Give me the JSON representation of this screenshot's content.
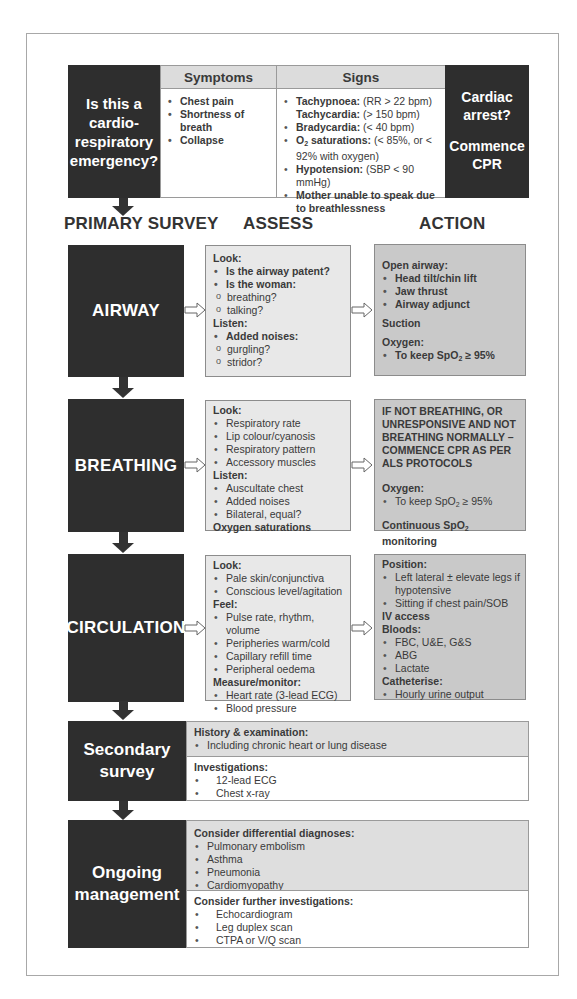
{
  "top_section": {
    "question": [
      "Is this a",
      "cardio-",
      "respiratory",
      "emergency?"
    ],
    "symptoms": {
      "header": "Symptoms",
      "items": [
        "Chest pain",
        "Shortness of breath",
        "Collapse"
      ]
    },
    "signs": {
      "header": "Signs",
      "items": [
        {
          "label": "Tachypnoea:",
          "value": " (RR > 22 bpm)"
        },
        {
          "label": "Tachycardia:",
          "value": " (> 150 bpm)"
        },
        {
          "label": "Bradycardia:",
          "value": " (< 40 bpm)"
        },
        {
          "label_prefix": "O",
          "label_sub": "2",
          "label": " saturations:",
          "value": " (< 85%, or < 92% with oxygen)"
        },
        {
          "label": "Hypotension:",
          "value": " (SBP < 90 mmHg)"
        },
        {
          "label": "Mother unable to speak due to breathlessness",
          "value": ""
        }
      ]
    },
    "arrest": {
      "question": [
        "Cardiac",
        "arrest?"
      ],
      "action": [
        "Commence",
        "CPR"
      ]
    }
  },
  "column_headers": {
    "primary": "PRIMARY SURVEY",
    "assess": "ASSESS",
    "action": "ACTION"
  },
  "airway": {
    "title": "AIRWAY",
    "assess": {
      "look_label": "Look:",
      "look_items": [
        "Is the airway patent?",
        "Is the woman:"
      ],
      "woman_sub_items": [
        "breathing?",
        "talking?"
      ],
      "listen_label": "Listen:",
      "listen_items": [
        "Added noises:"
      ],
      "noise_sub_items": [
        "gurgling?",
        "stridor?"
      ]
    },
    "action": {
      "open_label": "Open airway:",
      "open_items": [
        "Head tilt/chin lift",
        "Jaw thrust",
        "Airway adjunct"
      ],
      "suction": "Suction",
      "oxygen_label": "Oxygen:",
      "oxygen_item_prefix": "To keep SpO",
      "oxygen_item_sub": "2",
      "oxygen_item_suffix": " ≥ 95%"
    }
  },
  "breathing": {
    "title": "BREATHING",
    "assess": {
      "look_label": "Look:",
      "look_items": [
        "Respiratory rate",
        "Lip colour/cyanosis",
        "Respiratory pattern",
        "Accessory muscles"
      ],
      "listen_label": "Listen:",
      "listen_items": [
        "Auscultate chest",
        "Added noises",
        "Bilateral, equal?"
      ],
      "footer": "Oxygen saturations"
    },
    "action": {
      "warning": "IF NOT  BREATHING, OR UNRESPONSIVE AND NOT BREATHING NORMALLY – COMMENCE CPR AS PER ALS PROTOCOLS",
      "oxygen_label": "Oxygen:",
      "oxygen_item_prefix": "To keep SpO",
      "oxygen_item_sub": "2",
      "oxygen_item_suffix": " ≥ 95%",
      "monitor_prefix": "Continuous SpO",
      "monitor_sub": "2",
      "monitor_suffix": " monitoring"
    }
  },
  "circulation": {
    "title": "CIRCULATION",
    "assess": {
      "look_label": "Look:",
      "look_items": [
        "Pale skin/conjunctiva",
        "Conscious level/agitation"
      ],
      "feel_label": "Feel:",
      "feel_items": [
        "Pulse rate, rhythm, volume",
        "Peripheries warm/cold",
        "Capillary refill time",
        "Peripheral oedema"
      ],
      "measure_label": "Measure/monitor:",
      "measure_items": [
        "Heart rate (3-lead ECG)",
        "Blood pressure"
      ]
    },
    "action": {
      "position_label": "Position:",
      "position_items": [
        "Left lateral ± elevate legs if hypotensive",
        "Sitting if chest pain/SOB"
      ],
      "iv_access": "IV access",
      "bloods_label": "Bloods:",
      "bloods_items": [
        "FBC, U&E, G&S",
        "ABG",
        "Lactate"
      ],
      "catheterise_label": "Catheterise:",
      "catheterise_items": [
        "Hourly urine output"
      ]
    }
  },
  "secondary": {
    "title": [
      "Secondary",
      "survey"
    ],
    "history_label": "History & examination:",
    "history_items": [
      "Including chronic heart or lung disease"
    ],
    "investigations_label": "Investigations:",
    "investigations_items": [
      "12-lead ECG",
      "Chest x-ray"
    ]
  },
  "ongoing": {
    "title": [
      "Ongoing",
      "management"
    ],
    "differential_label": "Consider differential diagnoses:",
    "differential_items": [
      "Pulmonary embolism",
      "Asthma",
      "Pneumonia",
      "Cardiomyopathy"
    ],
    "further_label": "Consider further investigations:",
    "further_items": [
      "Echocardiogram",
      "Leg duplex scan",
      "CTPA or V/Q scan"
    ]
  },
  "colors": {
    "dark_box": "#2e2e2e",
    "assess_bg": "#e8e8e8",
    "action_bg": "#c9c9c9",
    "header_bg": "#dcdcdc",
    "border": "#9a9a9a"
  }
}
